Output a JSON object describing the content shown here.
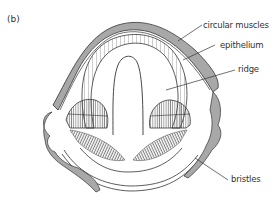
{
  "figure": {
    "panel_label": "(b)",
    "labels": {
      "circular_muscles": "circular muscles",
      "epithelium": "epithelium",
      "ridge": "ridge",
      "bristles": "bristles"
    },
    "colors": {
      "outline": "#333333",
      "muscle_fill": "#a8a8a8",
      "hatch": "#555555",
      "background": "#ffffff"
    }
  }
}
